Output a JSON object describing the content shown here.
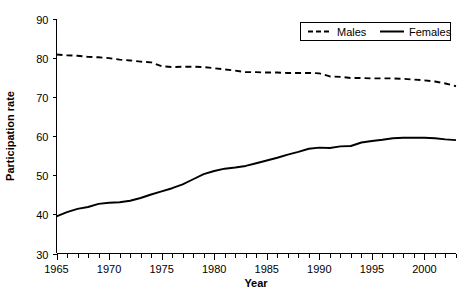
{
  "chart_data": {
    "type": "line",
    "title": "",
    "xlabel": "Year",
    "ylabel": "Participation rate",
    "xlim": [
      1965,
      2003
    ],
    "ylim": [
      30,
      90
    ],
    "grid": false,
    "legend_position": "top-right",
    "x_ticks_major": [
      1965,
      1970,
      1975,
      1980,
      1985,
      1990,
      1995,
      2000
    ],
    "x_tick_labels": [
      "1965",
      "1970",
      "1975",
      "1980",
      "1985",
      "1990",
      "1995",
      "2000"
    ],
    "x_minor_tick_step": 1,
    "y_ticks": [
      30,
      40,
      50,
      60,
      70,
      80,
      90
    ],
    "y_tick_labels": [
      "30",
      "40",
      "50",
      "60",
      "70",
      "80",
      "90"
    ],
    "x": [
      1965,
      1966,
      1967,
      1968,
      1969,
      1970,
      1971,
      1972,
      1973,
      1974,
      1975,
      1976,
      1977,
      1978,
      1979,
      1980,
      1981,
      1982,
      1983,
      1984,
      1985,
      1986,
      1987,
      1988,
      1989,
      1990,
      1991,
      1992,
      1993,
      1994,
      1995,
      1996,
      1997,
      1998,
      1999,
      2000,
      2001,
      2002,
      2003
    ],
    "series": [
      {
        "name": "Males",
        "style": "dashed",
        "color": "#000000",
        "values": [
          80.9,
          80.7,
          80.6,
          80.3,
          80.2,
          80.0,
          79.6,
          79.4,
          79.1,
          78.9,
          77.9,
          77.7,
          77.8,
          77.8,
          77.7,
          77.4,
          77.1,
          76.8,
          76.4,
          76.4,
          76.3,
          76.3,
          76.2,
          76.2,
          76.2,
          76.1,
          75.3,
          75.2,
          74.9,
          74.9,
          74.8,
          74.8,
          74.8,
          74.7,
          74.5,
          74.3,
          74.0,
          73.5,
          72.8
        ]
      },
      {
        "name": "Females",
        "style": "solid",
        "color": "#000000",
        "values": [
          39.5,
          40.6,
          41.4,
          41.9,
          42.7,
          43.0,
          43.1,
          43.5,
          44.2,
          45.1,
          45.9,
          46.7,
          47.7,
          49.0,
          50.3,
          51.1,
          51.7,
          52.0,
          52.4,
          53.1,
          53.8,
          54.5,
          55.3,
          56.0,
          56.8,
          57.1,
          57.0,
          57.4,
          57.5,
          58.4,
          58.8,
          59.1,
          59.5,
          59.6,
          59.6,
          59.6,
          59.5,
          59.2,
          59.0
        ]
      }
    ],
    "legend_entries": [
      {
        "label": "Males",
        "style": "dashed"
      },
      {
        "label": "Females",
        "style": "solid"
      }
    ]
  }
}
